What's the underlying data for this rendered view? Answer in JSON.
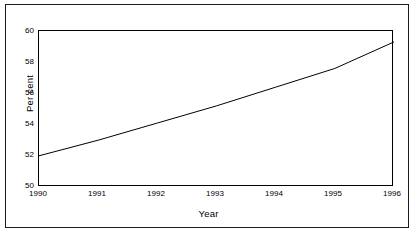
{
  "figure": {
    "background_color": "#ffffff",
    "line_color": "#000000",
    "frame_color": "#000000",
    "outer_border_color": "#1a1a1a"
  },
  "axes": {
    "ylabel": "Per cent",
    "xlabel": "Year",
    "ytick_labels": [
      "60",
      "58",
      "56",
      "54",
      "52",
      "50"
    ],
    "xtick_labels": [
      "1990",
      "1991",
      "1992",
      "1993",
      "1994",
      "1995",
      "1996"
    ]
  },
  "chart_data": {
    "type": "line",
    "title": "",
    "subtitle": "",
    "xlabel": "Year",
    "ylabel": "Per cent",
    "x": [
      1990,
      1991,
      1992,
      1993,
      1994,
      1995,
      1996
    ],
    "categories": [
      "1990",
      "1991",
      "1992",
      "1993",
      "1994",
      "1995",
      "1996"
    ],
    "values": [
      52.0,
      53.0,
      54.1,
      55.2,
      56.4,
      57.6,
      59.3
    ],
    "series": [
      {
        "name": "Per cent",
        "values": [
          52.0,
          53.0,
          54.1,
          55.2,
          56.4,
          57.6,
          59.3
        ]
      }
    ],
    "xlim": [
      1990,
      1996
    ],
    "ylim": [
      50,
      60
    ],
    "ytick_values": [
      50,
      52,
      54,
      56,
      58,
      60
    ],
    "xtick_values": [
      1990,
      1991,
      1992,
      1993,
      1994,
      1995,
      1996
    ],
    "grid": false,
    "legend": false,
    "legend_position": "none",
    "annotations": []
  }
}
